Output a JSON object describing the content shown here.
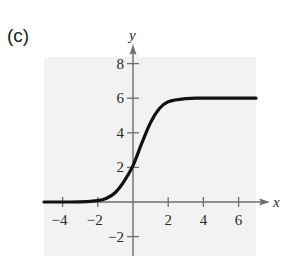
{
  "panel_label": "(c)",
  "colors": {
    "background_panel": "#f2f2f2",
    "axis": "#6e6e6e",
    "curve": "#111111",
    "text": "#2a2a2a"
  },
  "chart_data": {
    "type": "line",
    "title": "",
    "panel": "(c)",
    "xlabel": "x",
    "ylabel": "y",
    "xlim": [
      -5,
      7.5
    ],
    "ylim": [
      -3,
      9
    ],
    "x_ticks": [
      -4,
      -2,
      2,
      4,
      6
    ],
    "y_ticks": [
      -2,
      2,
      4,
      6,
      8
    ],
    "x_tick_labels": [
      "−4",
      "−2",
      "2",
      "4",
      "6"
    ],
    "y_tick_labels": [
      "−2",
      "2",
      "4",
      "6",
      "8"
    ],
    "grid": false,
    "legend": null,
    "series": [
      {
        "name": "logistic curve",
        "description": "S-shaped curve rising from horizontal asymptote y=0 to horizontal asymptote y=6",
        "x": [
          -5,
          -4,
          -3,
          -2,
          -1.5,
          -1,
          -0.5,
          0,
          0.5,
          1,
          1.5,
          2,
          3,
          4,
          5,
          6,
          7
        ],
        "y": [
          0,
          0,
          0.01,
          0.08,
          0.22,
          0.55,
          1.2,
          2.1,
          3.4,
          4.6,
          5.4,
          5.8,
          5.98,
          6,
          6,
          6,
          6
        ]
      }
    ]
  }
}
